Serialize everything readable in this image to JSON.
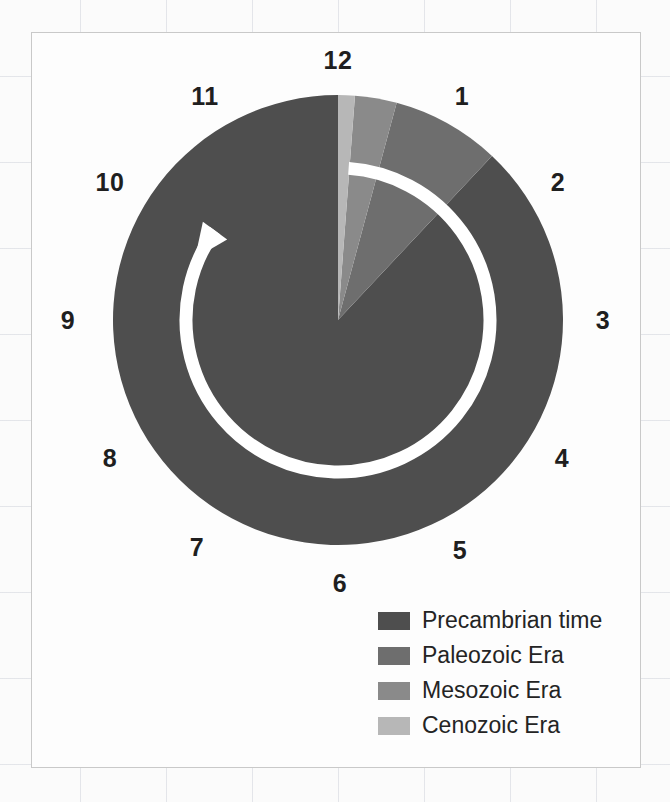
{
  "figure": {
    "kind": "geologic-time-clock",
    "frame_border_color": "#c9c9c9",
    "background_color": "#fdfdfd"
  },
  "clock": {
    "hour_labels": [
      "12",
      "1",
      "2",
      "3",
      "4",
      "5",
      "6",
      "7",
      "8",
      "9",
      "10",
      "11"
    ],
    "label_positions": [
      {
        "label": "12",
        "x": 338,
        "y": 60
      },
      {
        "label": "1",
        "x": 462,
        "y": 96
      },
      {
        "label": "2",
        "x": 558,
        "y": 182
      },
      {
        "label": "3",
        "x": 603,
        "y": 320
      },
      {
        "label": "4",
        "x": 562,
        "y": 458
      },
      {
        "label": "5",
        "x": 460,
        "y": 550
      },
      {
        "label": "6",
        "x": 340,
        "y": 583
      },
      {
        "label": "7",
        "x": 197,
        "y": 547
      },
      {
        "label": "8",
        "x": 110,
        "y": 458
      },
      {
        "label": "9",
        "x": 68,
        "y": 320
      },
      {
        "label": "10",
        "x": 110,
        "y": 182
      },
      {
        "label": "11",
        "x": 205,
        "y": 96
      }
    ],
    "center": {
      "x": 338,
      "y": 320
    },
    "radius": 225,
    "arrow_color": "#ffffff",
    "arrow_direction": "clockwise"
  },
  "chart_data": {
    "type": "pie",
    "title": "",
    "categories": [
      "Precambrian time",
      "Paleozoic Era",
      "Mesozoic Era",
      "Cenozoic Era"
    ],
    "values": [
      88.0,
      7.8,
      3.0,
      1.2
    ],
    "unit": "percent of geologic time",
    "colors": [
      "#4e4e4e",
      "#6e6e6e",
      "#8a8a8a",
      "#b7b7b7"
    ],
    "start_angle_deg": 0,
    "direction": "counterclockwise-from-12",
    "legend_position": "bottom-right",
    "grid": false
  },
  "legend": {
    "items": [
      {
        "label": "Precambrian time",
        "color": "#4e4e4e"
      },
      {
        "label": "Paleozoic Era",
        "color": "#6e6e6e"
      },
      {
        "label": "Mesozoic Era",
        "color": "#8a8a8a"
      },
      {
        "label": "Cenozoic Era",
        "color": "#b7b7b7"
      }
    ]
  }
}
